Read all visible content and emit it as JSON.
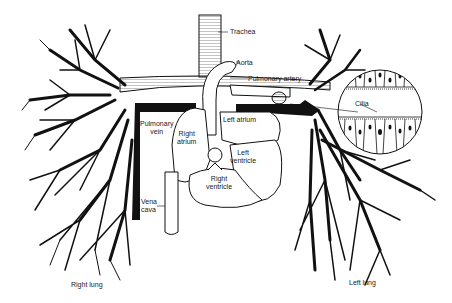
{
  "diagram": {
    "title": "",
    "type": "anatomical illustration",
    "colors": {
      "ink": "#111111",
      "background": "#ffffff",
      "label_text": "#222222"
    },
    "labels": {
      "trachea": "Trachea",
      "aorta": "Aorta",
      "pulmonary_artery": "Pulmonary artery",
      "cilia": "Cilia",
      "pulmonary_vein": "Pulmonary\nvein",
      "right_atrium": "Right\natrium",
      "left_atrium": "Left atrium",
      "left_ventricle": "Left\nventricle",
      "right_ventricle": "Right\nventricle",
      "vena_cava": "Vena\ncava",
      "right_lung": "Right lung",
      "left_lung": "Left lung"
    }
  }
}
